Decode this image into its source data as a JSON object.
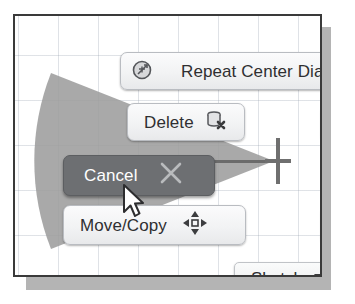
{
  "viewport": {
    "name": "sketch-canvas",
    "grid_visible": true,
    "grid_color": "#96a0af",
    "background_color": "#ffffff",
    "frame_color": "#3a3a3a"
  },
  "selection_wedge": {
    "label": "radial-selection-wedge",
    "color": "#9a9a9a"
  },
  "crosshair": {
    "label": "sketch-point-crosshair",
    "color": "#6f6f6f"
  },
  "marking_menu": {
    "items": [
      {
        "id": "repeat-center-diameter",
        "label": "Repeat Center Dia",
        "icon": "center-diameter-icon",
        "selected": false,
        "truncated": true
      },
      {
        "id": "delete",
        "label": "Delete",
        "icon": "delete-cylinder-icon",
        "selected": false,
        "truncated": false
      },
      {
        "id": "cancel",
        "label": "Cancel",
        "icon": "cancel-x-icon",
        "selected": true,
        "truncated": false
      },
      {
        "id": "move-copy",
        "label": "Move/Copy",
        "icon": "move-four-arrows-icon",
        "selected": false,
        "truncated": false
      }
    ],
    "selected_background": "#6d6f72",
    "selected_text_color": "#ffffff",
    "button_background": "#f2f3f4",
    "button_text_color": "#2f2f31"
  },
  "sketch_menu": {
    "label": "Sketch",
    "caret_icon": "chevron-down-icon",
    "expanded": false
  },
  "cursor": {
    "label": "mouse-pointer",
    "x": 110,
    "y": 172
  }
}
